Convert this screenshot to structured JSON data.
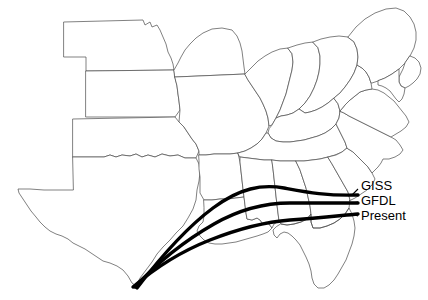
{
  "figure": {
    "background_color": "#ffffff",
    "width": 428,
    "height": 300,
    "type": "thematic-map"
  },
  "map": {
    "region_name": "Central and Eastern United States",
    "outline_color": "#4a4a4a",
    "fill_color": "#ffffff",
    "states": [
      "Nebraska",
      "Kansas",
      "Oklahoma",
      "Texas",
      "Iowa",
      "Missouri",
      "Arkansas",
      "Louisiana",
      "Illinois",
      "Indiana",
      "Ohio",
      "Kentucky",
      "Tennessee",
      "Mississippi",
      "Alabama",
      "Georgia",
      "Florida",
      "South Carolina",
      "North Carolina",
      "Virginia",
      "West Virginia",
      "Pennsylvania",
      "Maryland",
      "Delaware",
      "New Jersey"
    ]
  },
  "curves": [
    {
      "id": "giss",
      "label": "GISS",
      "color": "#000000",
      "stroke_width": 3.4,
      "rank": "northernmost"
    },
    {
      "id": "gfdl",
      "label": "GFDL",
      "color": "#000000",
      "stroke_width": 3.4,
      "rank": "middle"
    },
    {
      "id": "present",
      "label": "Present",
      "color": "#000000",
      "stroke_width": 3.4,
      "rank": "southernmost"
    }
  ],
  "legend": {
    "giss_label": "GISS",
    "gfdl_label": "GFDL",
    "present_label": "Present"
  }
}
